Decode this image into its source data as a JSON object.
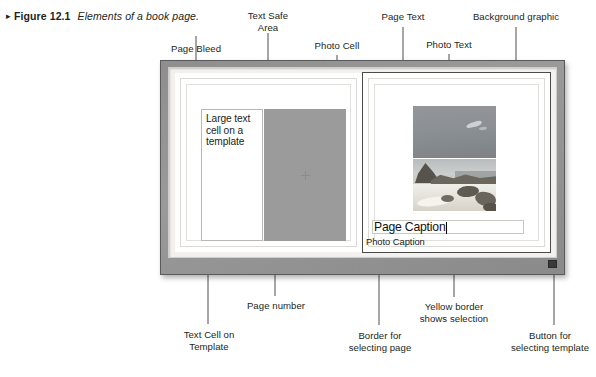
{
  "figure": {
    "marker": "▸",
    "number": "Figure 12.1",
    "description": "Elements of a book page."
  },
  "callouts": {
    "page_bleed": "Page Bleed",
    "text_safe_area": "Text Safe\nArea",
    "photo_cell": "Photo Cell",
    "page_text": "Page Text",
    "photo_text": "Photo Text",
    "background_graphic": "Background graphic",
    "text_cell_on_template": "Text Cell on\nTemplate",
    "page_number": "Page number",
    "border_for_selecting_page": "Border for\nselecting page",
    "yellow_border_shows_selection": "Yellow border\nshows selection",
    "button_for_selecting_template": "Button for\nselecting template"
  },
  "artwork": {
    "left_page": {
      "text_cell_content": "Large text cell on a template"
    },
    "right_page": {
      "photo_caption": "Photo Caption",
      "page_caption": "Page Caption"
    },
    "page_number_mark": "·"
  },
  "colors": {
    "frame": "#919191",
    "well": "#f2f1ef",
    "paper": "#ffffff",
    "photo_cell": "#9b9b9b",
    "selection": "#4a4a4a",
    "text": "#231f20",
    "leader": "#4d4d4d"
  }
}
